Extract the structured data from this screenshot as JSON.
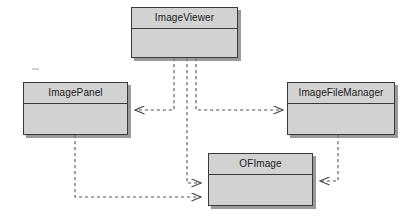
{
  "diagram": {
    "type": "uml-class-diagram",
    "background_color": "#ffffff",
    "class_fill_color": "#d2d2d2",
    "class_border_color": "#3a3a3a",
    "edge_color": "#555555",
    "edge_style": "dashed",
    "classes": [
      {
        "id": "image-viewer",
        "name": "ImageViewer",
        "x": 131,
        "y": 7,
        "width": 107,
        "height": 51
      },
      {
        "id": "image-panel",
        "name": "ImagePanel",
        "x": 23,
        "y": 82,
        "width": 105,
        "height": 53
      },
      {
        "id": "image-file-manager",
        "name": "ImageFileManager",
        "x": 287,
        "y": 82,
        "width": 108,
        "height": 53
      },
      {
        "id": "of-image",
        "name": "OFImage",
        "x": 208,
        "y": 153,
        "width": 105,
        "height": 53
      }
    ],
    "relationships": [
      {
        "id": "viewer-to-panel",
        "from": "ImageViewer",
        "to": "ImagePanel",
        "kind": "dependency",
        "arrow": "open-left",
        "label": ""
      },
      {
        "id": "viewer-to-file-manager",
        "from": "ImageViewer",
        "to": "ImageFileManager",
        "kind": "dependency",
        "arrow": "open-right",
        "label": ""
      },
      {
        "id": "viewer-to-of-image",
        "from": "ImageViewer",
        "to": "OFImage",
        "kind": "dependency",
        "arrow": "open-right",
        "label": ""
      },
      {
        "id": "panel-to-of-image",
        "from": "ImagePanel",
        "to": "OFImage",
        "kind": "dependency",
        "arrow": "open-right",
        "label": ""
      },
      {
        "id": "file-manager-to-of-image",
        "from": "ImageFileManager",
        "to": "OFImage",
        "kind": "dependency",
        "arrow": "open-left",
        "label": ""
      }
    ]
  }
}
